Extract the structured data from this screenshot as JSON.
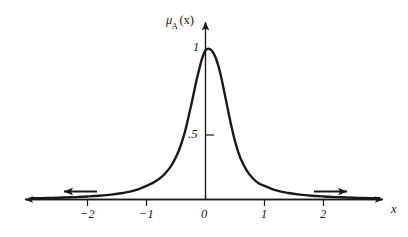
{
  "figure": {
    "background_color": "#ffffff",
    "ink_color": "#1a1a1a",
    "width": 408,
    "height": 237
  },
  "labels": {
    "y_axis_title_mu": "μ",
    "y_axis_title_sub": "A",
    "y_axis_title_arg": "(x)",
    "x_axis_title": "x",
    "y_tick_1": "1",
    "y_tick_half": ".5",
    "x_tick_neg2": "−2",
    "x_tick_neg1": "−1",
    "x_tick_0": "0",
    "x_tick_1": "1",
    "x_tick_2": "2"
  },
  "chart_data": {
    "type": "line",
    "title": "",
    "subtitle": "",
    "xlabel": "x",
    "ylabel": "μA(x)",
    "xlim": [
      -2.95,
      2.95
    ],
    "ylim": [
      0,
      1.12
    ],
    "grid": false,
    "legend": null,
    "x_ticks": [
      -2,
      -1,
      0,
      1,
      2
    ],
    "x_tick_labels": [
      "−2",
      "−1",
      "0",
      "1",
      "2"
    ],
    "y_ticks": [
      0.5,
      1
    ],
    "y_tick_labels": [
      ".5",
      "1"
    ],
    "axis_arrows": {
      "x_left": true,
      "x_right": true,
      "y_top": true
    },
    "curve_tail_arrows": {
      "left": true,
      "right": true
    },
    "annotations": [
      "Curve peaks at μA(0) = 1",
      "Half-maximum (.5) crossings near x = ±0.34",
      "Tails approach 0 asymptotically and merge with the x-axis beyond |x| ≈ 1.8"
    ],
    "series": [
      {
        "name": "μA(x)",
        "color": "#1a1a1a",
        "line_width": 2.4,
        "x": [
          -2.95,
          -2.8,
          -2.6,
          -2.4,
          -2.2,
          -2.0,
          -1.8,
          -1.6,
          -1.4,
          -1.2,
          -1.0,
          -0.9,
          -0.8,
          -0.7,
          -0.6,
          -0.55,
          -0.5,
          -0.45,
          -0.4,
          -0.35,
          -0.3,
          -0.25,
          -0.2,
          -0.15,
          -0.1,
          -0.05,
          0.0,
          0.05,
          0.1,
          0.15,
          0.2,
          0.25,
          0.3,
          0.35,
          0.4,
          0.45,
          0.5,
          0.55,
          0.6,
          0.7,
          0.8,
          0.9,
          1.0,
          1.2,
          1.4,
          1.6,
          1.8,
          2.0,
          2.2,
          2.4,
          2.6,
          2.8,
          2.95
        ],
        "y": [
          0.008,
          0.009,
          0.011,
          0.013,
          0.016,
          0.02,
          0.025,
          0.032,
          0.043,
          0.06,
          0.09,
          0.108,
          0.132,
          0.165,
          0.212,
          0.243,
          0.28,
          0.325,
          0.38,
          0.445,
          0.525,
          0.61,
          0.7,
          0.79,
          0.87,
          0.94,
          0.985,
          0.995,
          0.985,
          0.955,
          0.905,
          0.835,
          0.745,
          0.65,
          0.555,
          0.465,
          0.385,
          0.32,
          0.265,
          0.19,
          0.14,
          0.108,
          0.09,
          0.06,
          0.043,
          0.032,
          0.025,
          0.02,
          0.016,
          0.013,
          0.011,
          0.009,
          0.008
        ]
      }
    ]
  }
}
